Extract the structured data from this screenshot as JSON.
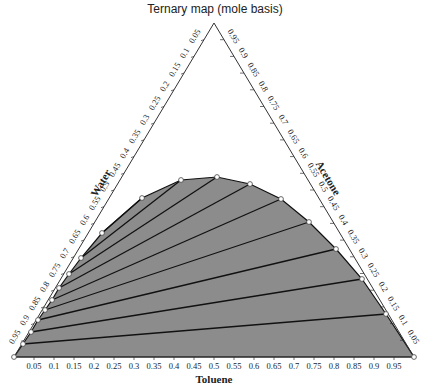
{
  "chart_data": {
    "type": "ternary",
    "title": "Ternary map (mole basis)",
    "axes": {
      "bottom": {
        "label": "Toluene",
        "ticks": [
          "0.05",
          "0.1",
          "0.15",
          "0.2",
          "0.25",
          "0.3",
          "0.35",
          "0.4",
          "0.45",
          "0.5",
          "0.55",
          "0.6",
          "0.65",
          "0.7",
          "0.75",
          "0.8",
          "0.85",
          "0.9",
          "0.95"
        ]
      },
      "left": {
        "label": "Water",
        "ticks": [
          "0.05",
          "0.1",
          "0.15",
          "0.2",
          "0.25",
          "0.3",
          "0.35",
          "0.4",
          "0.45",
          "0.5",
          "0.55",
          "0.6",
          "0.65",
          "0.7",
          "0.75",
          "0.8",
          "0.85",
          "0.9",
          "0.95"
        ]
      },
      "right": {
        "label": "Acetone",
        "ticks": [
          "0.95",
          "0.9",
          "0.85",
          "0.8",
          "0.75",
          "0.7",
          "0.65",
          "0.6",
          "0.55",
          "0.5",
          "0.45",
          "0.4",
          "0.35",
          "0.3",
          "0.25",
          "0.2",
          "0.15",
          "0.1",
          "0.05"
        ]
      }
    },
    "region_fill": "#8c8c8c",
    "binodal_points_px": [
      [
        14,
        357
      ],
      [
        23,
        344
      ],
      [
        31,
        332
      ],
      [
        38,
        320
      ],
      [
        45,
        310
      ],
      [
        52,
        300
      ],
      [
        59,
        288
      ],
      [
        69,
        274
      ],
      [
        81,
        258
      ],
      [
        102,
        233
      ],
      [
        142,
        198
      ],
      [
        181,
        180
      ],
      [
        217,
        177
      ],
      [
        250,
        184
      ],
      [
        281,
        199
      ],
      [
        309,
        222
      ],
      [
        336,
        249
      ],
      [
        362,
        279
      ],
      [
        386,
        314
      ],
      [
        414,
        357
      ]
    ],
    "tie_lines_px": [
      [
        [
          23,
          344
        ],
        [
          386,
          314
        ]
      ],
      [
        [
          31,
          332
        ],
        [
          362,
          279
        ]
      ],
      [
        [
          38,
          320
        ],
        [
          336,
          249
        ]
      ],
      [
        [
          45,
          310
        ],
        [
          309,
          222
        ]
      ],
      [
        [
          52,
          300
        ],
        [
          281,
          199
        ]
      ],
      [
        [
          59,
          288
        ],
        [
          250,
          184
        ]
      ],
      [
        [
          69,
          274
        ],
        [
          217,
          177
        ]
      ],
      [
        [
          81,
          258
        ],
        [
          181,
          180
        ]
      ],
      [
        [
          102,
          233
        ],
        [
          142,
          198
        ]
      ]
    ]
  }
}
